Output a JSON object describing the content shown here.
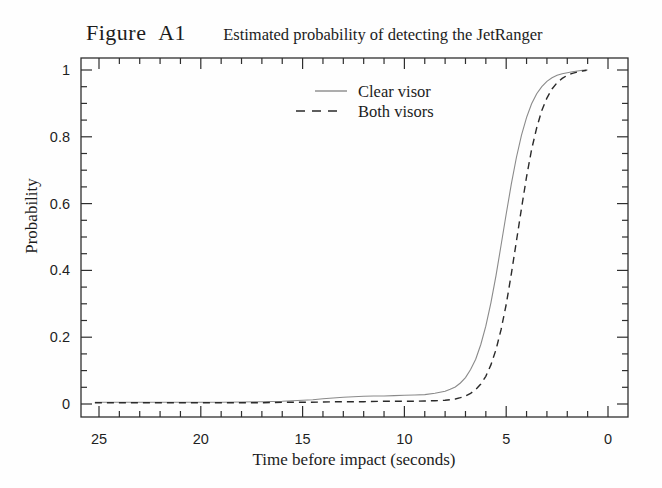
{
  "title": {
    "figure_label": "Figure A1",
    "caption": "Estimated probability of detecting the JetRanger"
  },
  "legend": {
    "items": [
      {
        "label": "Clear visor",
        "style": "solid",
        "color": "#8a8a8a"
      },
      {
        "label": "Both visors",
        "style": "dashed",
        "color": "#2a2a2a"
      }
    ]
  },
  "colors": {
    "ink": "#1f1f1f",
    "axis": "#2e2e2e",
    "clear_visor_line": "#8a8a8a",
    "both_visors_line": "#2a2a2a",
    "background": "#fefefe"
  },
  "chart_data": {
    "type": "line",
    "title": "Estimated probability of detecting the JetRanger",
    "xlabel": "Time before impact  (seconds)",
    "ylabel": "Probability",
    "x_reversed": true,
    "xlim": [
      25.9,
      -1.0
    ],
    "ylim": [
      -0.042,
      1.036
    ],
    "x_major_ticks": [
      25,
      20,
      15,
      10,
      5,
      0
    ],
    "x_major_labels": [
      "25",
      "20",
      "15",
      "10",
      "5",
      "0"
    ],
    "x_minor_step": 1,
    "y_major_ticks": [
      0,
      0.2,
      0.4,
      0.6,
      0.8,
      1
    ],
    "y_major_labels": [
      "0",
      "0.2",
      "0.4",
      "0.6",
      "0.8",
      "1"
    ],
    "y_minor_step": 0.05,
    "grid": false,
    "legend_position": "upper-left-inside",
    "series": [
      {
        "name": "Clear visor",
        "line": "solid",
        "color": "#8a8a8a",
        "points": [
          [
            25.2,
            0.005
          ],
          [
            24,
            0.005
          ],
          [
            23,
            0.005
          ],
          [
            22,
            0.005
          ],
          [
            21,
            0.005
          ],
          [
            20,
            0.005
          ],
          [
            19,
            0.005
          ],
          [
            18,
            0.006
          ],
          [
            17,
            0.007
          ],
          [
            16,
            0.008
          ],
          [
            15.5,
            0.01
          ],
          [
            15,
            0.011
          ],
          [
            14.5,
            0.013
          ],
          [
            14,
            0.016
          ],
          [
            13.5,
            0.018
          ],
          [
            13,
            0.02
          ],
          [
            12.5,
            0.022
          ],
          [
            12,
            0.023
          ],
          [
            11.5,
            0.024
          ],
          [
            11,
            0.024
          ],
          [
            10.5,
            0.025
          ],
          [
            10,
            0.026
          ],
          [
            9.5,
            0.027
          ],
          [
            9,
            0.028
          ],
          [
            8.5,
            0.032
          ],
          [
            8,
            0.038
          ],
          [
            7.75,
            0.044
          ],
          [
            7.5,
            0.051
          ],
          [
            7.25,
            0.063
          ],
          [
            7,
            0.079
          ],
          [
            6.75,
            0.103
          ],
          [
            6.5,
            0.134
          ],
          [
            6.25,
            0.178
          ],
          [
            6,
            0.233
          ],
          [
            5.75,
            0.303
          ],
          [
            5.5,
            0.384
          ],
          [
            5.25,
            0.476
          ],
          [
            5,
            0.569
          ],
          [
            4.75,
            0.658
          ],
          [
            4.5,
            0.738
          ],
          [
            4.25,
            0.805
          ],
          [
            4,
            0.858
          ],
          [
            3.75,
            0.899
          ],
          [
            3.5,
            0.929
          ],
          [
            3.25,
            0.95
          ],
          [
            3,
            0.966
          ],
          [
            2.75,
            0.977
          ],
          [
            2.5,
            0.984
          ],
          [
            2.25,
            0.989
          ],
          [
            2,
            0.992
          ],
          [
            1.75,
            0.995
          ],
          [
            1.5,
            0.997
          ],
          [
            1.25,
            0.999
          ],
          [
            1,
            1.0
          ]
        ]
      },
      {
        "name": "Both visors",
        "line": "dashed",
        "color": "#2a2a2a",
        "points": [
          [
            25.2,
            0.004
          ],
          [
            24,
            0.004
          ],
          [
            23,
            0.004
          ],
          [
            22,
            0.004
          ],
          [
            21,
            0.004
          ],
          [
            20,
            0.004
          ],
          [
            19,
            0.004
          ],
          [
            18,
            0.004
          ],
          [
            17,
            0.004
          ],
          [
            16,
            0.005
          ],
          [
            15,
            0.005
          ],
          [
            14,
            0.006
          ],
          [
            13,
            0.007
          ],
          [
            12,
            0.007
          ],
          [
            11,
            0.008
          ],
          [
            10,
            0.008
          ],
          [
            9.5,
            0.008
          ],
          [
            9,
            0.009
          ],
          [
            8.5,
            0.01
          ],
          [
            8,
            0.011
          ],
          [
            7.75,
            0.013
          ],
          [
            7.5,
            0.015
          ],
          [
            7.25,
            0.019
          ],
          [
            7,
            0.024
          ],
          [
            6.75,
            0.032
          ],
          [
            6.5,
            0.043
          ],
          [
            6.25,
            0.06
          ],
          [
            6,
            0.083
          ],
          [
            5.75,
            0.117
          ],
          [
            5.5,
            0.163
          ],
          [
            5.25,
            0.223
          ],
          [
            5,
            0.298
          ],
          [
            4.75,
            0.389
          ],
          [
            4.5,
            0.487
          ],
          [
            4.25,
            0.586
          ],
          [
            4,
            0.681
          ],
          [
            3.75,
            0.762
          ],
          [
            3.5,
            0.827
          ],
          [
            3.25,
            0.879
          ],
          [
            3,
            0.916
          ],
          [
            2.75,
            0.943
          ],
          [
            2.5,
            0.962
          ],
          [
            2.25,
            0.975
          ],
          [
            2,
            0.984
          ],
          [
            1.75,
            0.99
          ],
          [
            1.5,
            0.994
          ],
          [
            1.25,
            0.997
          ],
          [
            1.05,
            0.999
          ]
        ]
      }
    ]
  }
}
